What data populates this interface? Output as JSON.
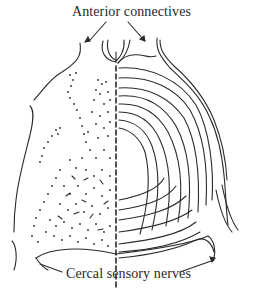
{
  "figure": {
    "labels": {
      "top": "Anterior connectives",
      "bottom": "Cercal sensory nerves"
    },
    "colors": {
      "ink": "#2b2b2b",
      "background": "#ffffff"
    }
  }
}
